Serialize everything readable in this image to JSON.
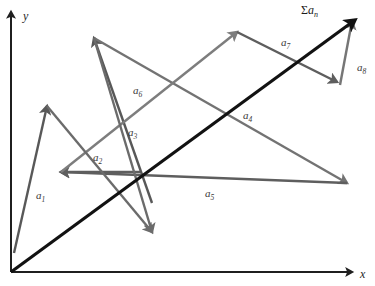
{
  "figure": {
    "background_color": "#ffffff",
    "width": 375,
    "height": 286
  },
  "axes": {
    "color": "#1f1f1f",
    "origin": {
      "x": 11,
      "y": 272
    },
    "x_axis": {
      "label": "x",
      "label_pos": {
        "x": 360,
        "y": 268
      },
      "from": {
        "x": 11,
        "y": 272
      },
      "to": {
        "x": 352,
        "y": 272
      }
    },
    "y_axis": {
      "label": "y",
      "label_pos": {
        "x": 23,
        "y": 10
      },
      "from": {
        "x": 11,
        "y": 272
      },
      "to": {
        "x": 11,
        "y": 12
      }
    }
  },
  "resultant": {
    "label_sigma": "Σ",
    "label_a": "a",
    "label_sub": "n",
    "label_full": "Σaₙ",
    "color": "#121212",
    "width": 3.1,
    "from": {
      "x": 11,
      "y": 272
    },
    "to": {
      "x": 355,
      "y": 20
    },
    "label_pos": {
      "x": 301,
      "y": 4
    }
  },
  "vectors": [
    {
      "id": "a1",
      "label": "a",
      "sub": "1",
      "color": "#585858",
      "width": 2.4,
      "from": {
        "x": 14,
        "y": 253
      },
      "to": {
        "x": 47,
        "y": 106
      },
      "label_pos": {
        "x": 36,
        "y": 190
      }
    },
    {
      "id": "a2",
      "label": "a",
      "sub": "2",
      "color": "#5e5e5e",
      "width": 2.4,
      "from": {
        "x": 140,
        "y": 172
      },
      "to": {
        "x": 61,
        "y": 172
      },
      "label_pos": {
        "x": 93,
        "y": 152
      }
    },
    {
      "id": "a3",
      "label": "a",
      "sub": "3",
      "color": "#585858",
      "width": 2.4,
      "from": {
        "x": 152,
        "y": 203
      },
      "to": {
        "x": 94,
        "y": 38
      },
      "label_pos": {
        "x": 128,
        "y": 127
      }
    },
    {
      "id": "a4",
      "label": "a",
      "sub": "4",
      "color": "#737373",
      "width": 2.4,
      "from": {
        "x": 94,
        "y": 38
      },
      "to": {
        "x": 347,
        "y": 183
      },
      "label_pos": {
        "x": 243,
        "y": 110
      }
    },
    {
      "id": "a5",
      "label": "a",
      "sub": "5",
      "color": "#5e5e5e",
      "width": 2.4,
      "from": {
        "x": 347,
        "y": 183
      },
      "to": {
        "x": 61,
        "y": 172
      },
      "label_pos": {
        "x": 205,
        "y": 188
      }
    },
    {
      "id": "a6",
      "label": "a",
      "sub": "6",
      "color": "#7d7d7d",
      "width": 2.4,
      "from": {
        "x": 61,
        "y": 172
      },
      "to": {
        "x": 237,
        "y": 32
      },
      "label_pos": {
        "x": 133,
        "y": 85
      }
    },
    {
      "id": "a7",
      "label": "a",
      "sub": "7",
      "color": "#5e5e5e",
      "width": 2.4,
      "from": {
        "x": 237,
        "y": 32
      },
      "to": {
        "x": 337,
        "y": 82
      },
      "label_pos": {
        "x": 281,
        "y": 37
      }
    },
    {
      "id": "a8",
      "label": "a",
      "sub": "8",
      "color": "#767676",
      "width": 2.4,
      "from": {
        "x": 340,
        "y": 85
      },
      "to": {
        "x": 352,
        "y": 21
      },
      "label_pos": {
        "x": 357,
        "y": 62
      }
    },
    {
      "id": "a6b",
      "label": "",
      "sub": "",
      "color": "#6b6b6b",
      "width": 2.4,
      "from": {
        "x": 94,
        "y": 38
      },
      "to": {
        "x": 152,
        "y": 232
      },
      "label_pos": {
        "x": 0,
        "y": 0
      }
    },
    {
      "id": "a1b",
      "label": "",
      "sub": "",
      "color": "#6b6b6b",
      "width": 2.4,
      "from": {
        "x": 47,
        "y": 106
      },
      "to": {
        "x": 152,
        "y": 232
      },
      "label_pos": {
        "x": 0,
        "y": 0
      }
    }
  ],
  "chart_data": {
    "type": "diagram",
    "subtype": "vector-polygon",
    "xlabel": "x",
    "ylabel": "y",
    "vector_labels": [
      "a₁",
      "a₂",
      "a₃",
      "a₄",
      "a₅",
      "a₆",
      "a₇",
      "a₈"
    ],
    "resultant_label": "Σaₙ"
  }
}
